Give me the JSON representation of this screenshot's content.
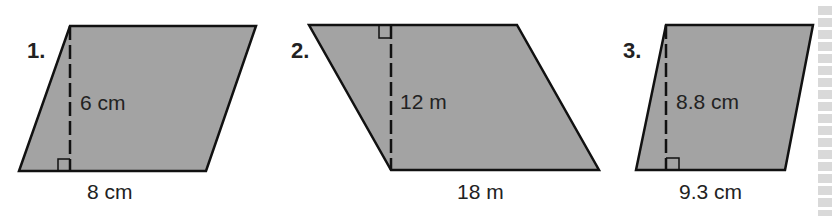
{
  "figure": {
    "fill_color": "#a3a3a3",
    "stroke_color": "#111111",
    "text_color": "#222222",
    "problems": [
      {
        "number": "1.",
        "height_label": "6 cm",
        "base_label": "8 cm",
        "height": 6,
        "base": 8,
        "unit": "cm",
        "right_angle_mark": "bottom"
      },
      {
        "number": "2.",
        "height_label": "12 m",
        "base_label": "18 m",
        "height": 12,
        "base": 18,
        "unit": "m",
        "right_angle_mark": "top"
      },
      {
        "number": "3.",
        "height_label": "8.8 cm",
        "base_label": "9.3 cm",
        "height": 8.8,
        "base": 9.3,
        "unit": "cm",
        "right_angle_mark": "bottom"
      }
    ]
  }
}
